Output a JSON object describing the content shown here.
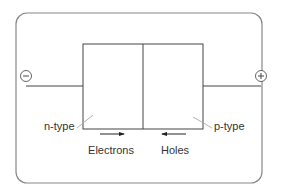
{
  "diagram": {
    "colors": {
      "frame": "#888888",
      "lines": "#444444",
      "leader": "#aaaaaa",
      "text": "#333333"
    },
    "terminals": {
      "negative": {
        "symbol": "−",
        "icon": "minus-circle-icon"
      },
      "positive": {
        "symbol": "+",
        "icon": "plus-circle-icon"
      }
    },
    "regions": [
      {
        "name": "n-type",
        "label": "n-type"
      },
      {
        "name": "p-type",
        "label": "p-type"
      }
    ],
    "carriers": [
      {
        "label": "Electrons",
        "direction": "right"
      },
      {
        "label": "Holes",
        "direction": "left"
      }
    ]
  }
}
